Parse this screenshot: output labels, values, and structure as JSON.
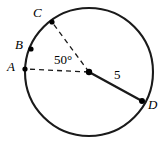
{
  "figure": {
    "width": 166,
    "height": 144,
    "background_color": "#ffffff",
    "stroke_color": "#000000"
  },
  "circle": {
    "center": {
      "x": 89,
      "y": 72
    },
    "radius_px": 64,
    "stroke_width": 2.1,
    "stroke_color": "#1a1a1a",
    "fill": "none"
  },
  "points": [
    {
      "id": "C",
      "label": "C",
      "x": 52,
      "y": 22,
      "label_x": 33,
      "label_y": 6,
      "dot_r": 2.6
    },
    {
      "id": "B",
      "label": "B",
      "x": 31,
      "y": 49,
      "label_x": 15,
      "label_y": 38,
      "dot_r": 2.6
    },
    {
      "id": "A",
      "label": "A",
      "x": 25,
      "y": 69,
      "label_x": 7,
      "label_y": 60,
      "dot_r": 2.6
    },
    {
      "id": "D",
      "label": "D",
      "x": 142,
      "y": 101,
      "label_x": 148,
      "label_y": 98,
      "dot_r": 3.0
    },
    {
      "id": "O",
      "label": "",
      "x": 89,
      "y": 72,
      "label_x": 0,
      "label_y": 0,
      "dot_r": 3.2
    }
  ],
  "segments": [
    {
      "id": "radius-to-A",
      "from": "O",
      "to": "A",
      "style": "dashed",
      "dash": "5,4",
      "stroke_width": 1.3,
      "label": ""
    },
    {
      "id": "radius-to-C",
      "from": "O",
      "to": "C",
      "style": "dashed",
      "dash": "5,4",
      "stroke_width": 1.3,
      "label": ""
    },
    {
      "id": "radius-to-D",
      "from": "O",
      "to": "D",
      "style": "solid",
      "dash": "",
      "stroke_width": 2.4,
      "label": "5"
    }
  ],
  "labels": {
    "angle": "50°",
    "radius_length": "5",
    "point_a": "A",
    "point_b": "B",
    "point_c": "C",
    "point_d": "D"
  },
  "annotations": {
    "central_angle_degrees": 50,
    "central_angle_vertex": "O",
    "central_angle_rays": [
      "A",
      "C"
    ],
    "radius_measure": 5
  }
}
